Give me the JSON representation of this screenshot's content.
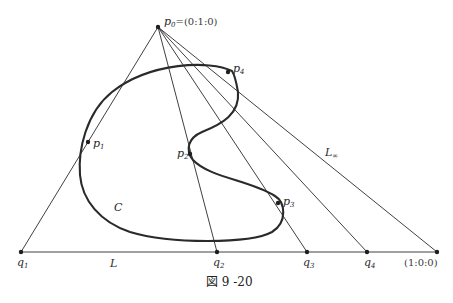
{
  "figure": {
    "caption": "図 9 -20",
    "vertex_label": {
      "name": "p",
      "sub": "0",
      "coords": "=(0:1:0)"
    },
    "infinity_point_label": "(1:0:0)",
    "line_labels": {
      "L": "L",
      "L_inf": {
        "name": "L",
        "sub": "∞"
      }
    },
    "curve_label": "C",
    "curve_points": [
      {
        "name": "p",
        "sub": "1"
      },
      {
        "name": "p",
        "sub": "2"
      },
      {
        "name": "p",
        "sub": "3"
      },
      {
        "name": "p",
        "sub": "4"
      }
    ],
    "base_points": [
      {
        "name": "q",
        "sub": "1"
      },
      {
        "name": "q",
        "sub": "2"
      },
      {
        "name": "q",
        "sub": "3"
      },
      {
        "name": "q",
        "sub": "4"
      }
    ]
  }
}
